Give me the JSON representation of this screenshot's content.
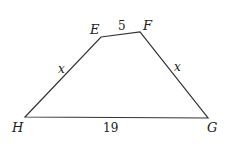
{
  "figure": {
    "type": "quadrilateral",
    "colors": {
      "stroke": "#333333",
      "text": "#222222",
      "background": "#ffffff"
    },
    "vertices": [
      {
        "label": "E",
        "x": 101,
        "y": 37,
        "label_x": 90,
        "label_y": 34
      },
      {
        "label": "F",
        "x": 140,
        "y": 32,
        "label_x": 143,
        "label_y": 30
      },
      {
        "label": "G",
        "x": 208,
        "y": 118,
        "label_x": 207,
        "label_y": 132
      },
      {
        "label": "H",
        "x": 25,
        "y": 117,
        "label_x": 12,
        "label_y": 132
      }
    ],
    "sides": [
      {
        "from": "E",
        "to": "F",
        "label": "5",
        "label_x": 118,
        "label_y": 30,
        "italic": false
      },
      {
        "from": "F",
        "to": "G",
        "label": "x",
        "label_x": 174,
        "label_y": 71,
        "italic": true
      },
      {
        "from": "G",
        "to": "H",
        "label": "19",
        "label_x": 103,
        "label_y": 132,
        "italic": false
      },
      {
        "from": "H",
        "to": "E",
        "label": "x",
        "label_x": 58,
        "label_y": 73,
        "italic": true
      }
    ]
  }
}
